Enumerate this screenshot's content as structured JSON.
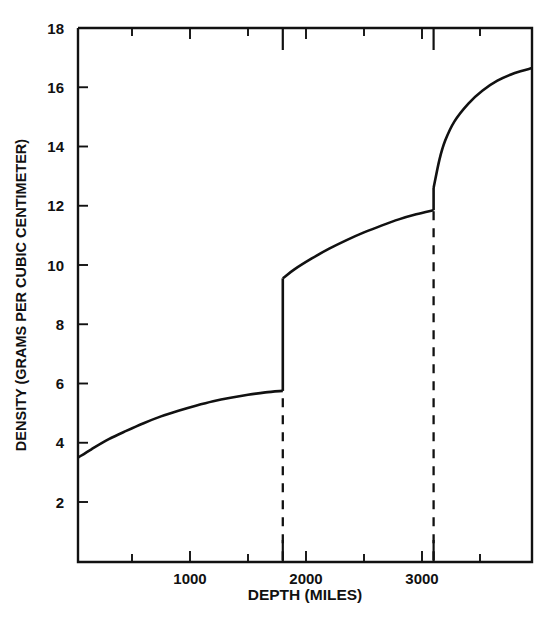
{
  "chart_data": {
    "type": "line",
    "title": "",
    "xlabel": "DEPTH (MILES)",
    "ylabel": "DENSITY (GRAMS PER CUBIC CENTIMETER)",
    "xlim": [
      35,
      3950
    ],
    "ylim": [
      0,
      18
    ],
    "grid": false,
    "legend": null,
    "x_major_ticks": [
      1000,
      2000,
      3000
    ],
    "x_major_tick_labels": [
      "1000",
      "2000",
      "3000"
    ],
    "x_minor_ticks": [
      500,
      1500,
      2500,
      3500
    ],
    "y_ticks": [
      2,
      4,
      6,
      8,
      10,
      12,
      14,
      16,
      18
    ],
    "y_tick_labels": [
      "2",
      "4",
      "6",
      "8",
      "10",
      "12",
      "14",
      "16",
      "18"
    ],
    "annotations": [
      {
        "name": "mantle-core-boundary",
        "x": 1800,
        "type": "vertical-dashed-line",
        "from_y": 0,
        "to_y": 5.75
      },
      {
        "name": "outer-inner-core-boundary",
        "x": 3100,
        "type": "vertical-dashed-line",
        "from_y": 0,
        "to_y": 11.85
      }
    ],
    "discontinuities": [
      {
        "x": 1800,
        "y_before": 5.75,
        "y_after": 9.55
      },
      {
        "x": 3100,
        "y_before": 11.85,
        "y_after": 12.6
      }
    ],
    "series": [
      {
        "name": "Earth density profile",
        "segments": [
          {
            "name": "mantle",
            "points": [
              [
                35,
                3.5
              ],
              [
                150,
                3.78
              ],
              [
                300,
                4.12
              ],
              [
                450,
                4.4
              ],
              [
                600,
                4.66
              ],
              [
                750,
                4.89
              ],
              [
                900,
                5.08
              ],
              [
                1050,
                5.25
              ],
              [
                1200,
                5.4
              ],
              [
                1350,
                5.52
              ],
              [
                1500,
                5.62
              ],
              [
                1650,
                5.7
              ],
              [
                1800,
                5.75
              ]
            ]
          },
          {
            "name": "outer-core",
            "points": [
              [
                1800,
                9.55
              ],
              [
                1900,
                9.85
              ],
              [
                2050,
                10.22
              ],
              [
                2200,
                10.55
              ],
              [
                2350,
                10.84
              ],
              [
                2500,
                11.1
              ],
              [
                2650,
                11.33
              ],
              [
                2800,
                11.54
              ],
              [
                2950,
                11.71
              ],
              [
                3100,
                11.85
              ]
            ]
          },
          {
            "name": "inner-core",
            "points": [
              [
                3100,
                12.6
              ],
              [
                3150,
                13.55
              ],
              [
                3200,
                14.2
              ],
              [
                3280,
                14.85
              ],
              [
                3400,
                15.45
              ],
              [
                3520,
                15.88
              ],
              [
                3650,
                16.22
              ],
              [
                3800,
                16.48
              ],
              [
                3950,
                16.65
              ]
            ]
          }
        ]
      }
    ]
  }
}
